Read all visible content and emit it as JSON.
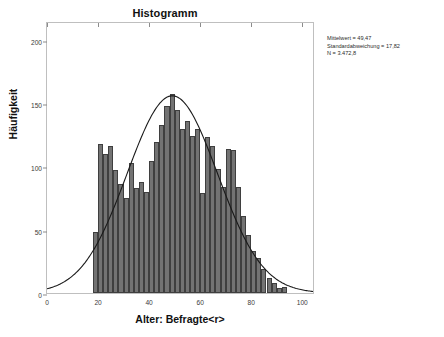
{
  "chart_data": {
    "type": "bar",
    "title": "Histogramm",
    "xlabel": "Alter: Befragte<r>",
    "ylabel": "Häufigkeit",
    "xlim": [
      0,
      105
    ],
    "ylim": [
      0,
      215
    ],
    "x_ticks": [
      0,
      20,
      40,
      60,
      80,
      100
    ],
    "y_ticks": [
      0,
      50,
      100,
      150,
      200
    ],
    "grid": false,
    "legend": null,
    "bin_width": 2,
    "bin_starts": [
      18,
      20,
      22,
      24,
      26,
      28,
      30,
      32,
      34,
      36,
      38,
      40,
      42,
      44,
      46,
      48,
      50,
      52,
      54,
      56,
      58,
      60,
      62,
      64,
      66,
      68,
      70,
      72,
      74,
      76,
      78,
      80,
      82,
      84,
      86,
      88,
      90,
      92
    ],
    "values": [
      48,
      118,
      110,
      116,
      97,
      86,
      75,
      103,
      83,
      88,
      80,
      104,
      119,
      133,
      148,
      157,
      145,
      130,
      136,
      124,
      130,
      79,
      123,
      116,
      98,
      84,
      114,
      113,
      84,
      61,
      46,
      33,
      28,
      19,
      12,
      8,
      4,
      5
    ],
    "overlay": {
      "type": "line",
      "name": "Normalverteilungskurve",
      "mean": 49.47,
      "sd": 17.82,
      "peak_value": 157
    },
    "annotations": {
      "mean_label": "Mittelwert = 49,47",
      "sd_label": "Standardabweichung = 17,82",
      "n_label": "N = 3.472,8"
    },
    "colors": {
      "bar_fill": "#737373",
      "bar_outline": "#3f3f3f",
      "curve": "#1a1a1a",
      "frame": "#bfbfbf",
      "background": "#ffffff"
    }
  }
}
